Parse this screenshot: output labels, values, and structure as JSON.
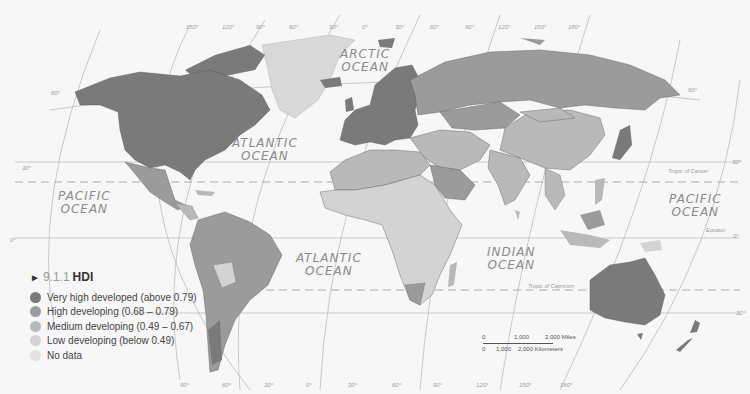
{
  "legend": {
    "section_number": "9.1.1",
    "title": "HDI",
    "items": [
      {
        "label": "Very high developed (above 0.79)",
        "color": "#7a7a7a"
      },
      {
        "label": "High developing (0.68 – 0.79)",
        "color": "#9b9b9b"
      },
      {
        "label": "Medium developing (0.49 – 0.67)",
        "color": "#b9b9b9"
      },
      {
        "label": "Low developing (below 0.49)",
        "color": "#d3d3d3"
      },
      {
        "label": "No data",
        "color": "#e2e2e2"
      }
    ]
  },
  "oceans": {
    "arctic": [
      "ARCTIC",
      "OCEAN"
    ],
    "atlantic_north": [
      "ATLANTIC",
      "OCEAN"
    ],
    "atlantic_south": [
      "ATLANTIC",
      "OCEAN"
    ],
    "pacific_west": [
      "PACIFIC",
      "OCEAN"
    ],
    "pacific_east": [
      "PACIFIC",
      "OCEAN"
    ],
    "indian": [
      "INDIAN",
      "OCEAN"
    ]
  },
  "annotations": {
    "tropic_cancer": "Tropic of Cancer",
    "tropic_capricorn": "Tropic of Capricorn",
    "equator": "Equator"
  },
  "grid_labels": {
    "lat_60_left": "60°",
    "lat_60_right": "60°",
    "lat_30_left": "30°",
    "lat_30_right": "30°",
    "lat_0_left": "0°",
    "lat_0_right": "0°",
    "lat_m30_right": "30°",
    "top_lons": [
      "150°",
      "120°",
      "90°",
      "60°",
      "30°",
      "0°",
      "30°",
      "60°",
      "90°",
      "120°",
      "150°",
      "180°"
    ],
    "bottom_lons": [
      "90°",
      "60°",
      "30°",
      "0°",
      "30°",
      "60°",
      "90°",
      "120°",
      "150°",
      "180°"
    ]
  },
  "scale_bar": {
    "miles_0": "0",
    "miles_1000": "1,000",
    "miles_2000": "2,000 Miles",
    "km_0": "0",
    "km_1000": "1,000",
    "km_2000": "2,000 Kilometers"
  }
}
